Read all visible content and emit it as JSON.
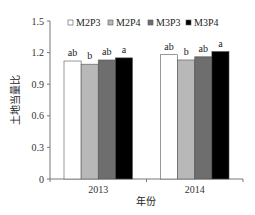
{
  "chart_data": {
    "type": "bar",
    "title": "",
    "xlabel": "年份",
    "ylabel": "土地当量比",
    "categories": [
      "2013",
      "2014"
    ],
    "series": [
      {
        "name": "M2P3",
        "color": "#ffffff",
        "values": [
          1.12,
          1.18
        ],
        "labels": [
          "ab",
          "ab"
        ]
      },
      {
        "name": "M2P4",
        "color": "#b8b8b8",
        "values": [
          1.09,
          1.13
        ],
        "labels": [
          "b",
          "b"
        ]
      },
      {
        "name": "M3P3",
        "color": "#6e6e6e",
        "values": [
          1.13,
          1.16
        ],
        "labels": [
          "ab",
          "ab"
        ]
      },
      {
        "name": "M3P4",
        "color": "#000000",
        "values": [
          1.15,
          1.21
        ],
        "labels": [
          "a",
          "a"
        ]
      }
    ],
    "ylim": [
      0,
      1.5
    ],
    "yticks": [
      "0",
      "0.3",
      "0.6",
      "0.9",
      "1.2",
      "1.5"
    ],
    "grid": false,
    "legend_position": "top-inside"
  }
}
